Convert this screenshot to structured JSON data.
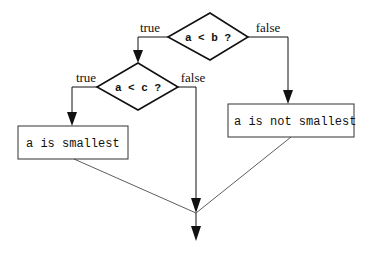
{
  "diagram": {
    "type": "flowchart",
    "decisions": [
      {
        "id": "d1",
        "text": "a < b ?",
        "true_label": "true",
        "false_label": "false"
      },
      {
        "id": "d2",
        "text": "a < c ?",
        "true_label": "true",
        "false_label": "false"
      }
    ],
    "processes": [
      {
        "id": "p1",
        "text": "a is smallest"
      },
      {
        "id": "p2",
        "text": "a is not smallest"
      }
    ],
    "edges": [
      {
        "from": "d1",
        "to": "d2",
        "label": "true"
      },
      {
        "from": "d1",
        "to": "p2",
        "label": "false"
      },
      {
        "from": "d2",
        "to": "p1",
        "label": "true"
      },
      {
        "from": "d2",
        "to": "merge",
        "label": "false"
      },
      {
        "from": "p1",
        "to": "merge",
        "label": ""
      },
      {
        "from": "p2",
        "to": "merge",
        "label": ""
      },
      {
        "from": "merge",
        "to": "exit",
        "label": ""
      }
    ]
  }
}
